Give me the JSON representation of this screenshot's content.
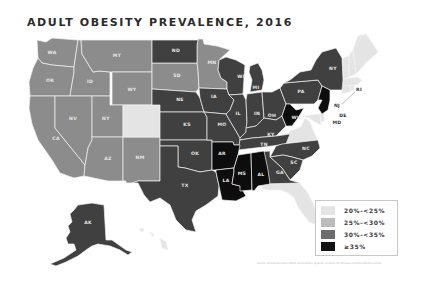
{
  "title": "ADULT OBESITY PREVALENCE, 2016",
  "colors": {
    "bin_20_25": "#e4e4e4",
    "bin_25_30": "#8c8c8c",
    "bin_30_35": "#404040",
    "bin_35_plus": "#0d0d0d"
  },
  "legend": {
    "items": [
      {
        "label": "20%-<25%",
        "color": "#e4e4e4"
      },
      {
        "label": "25%-<30%",
        "color": "#bcbcbc"
      },
      {
        "label": "30%-<35%",
        "color": "#6c6c6c"
      },
      {
        "label": "≥35%",
        "color": "#131313"
      }
    ]
  },
  "states": {
    "WA": "25%-<30%",
    "OR": "25%-<30%",
    "CA": "25%-<30%",
    "ID": "25%-<30%",
    "NV": "25%-<30%",
    "MT": "25%-<30%",
    "WY": "25%-<30%",
    "UT": "25%-<30%",
    "CO": "20%-<25%",
    "AZ": "25%-<30%",
    "NM": "25%-<30%",
    "ND": "30%-<35%",
    "SD": "25%-<30%",
    "NE": "30%-<35%",
    "KS": "30%-<35%",
    "OK": "30%-<35%",
    "TX": "30%-<35%",
    "MN": "25%-<30%",
    "IA": "30%-<35%",
    "MO": "30%-<35%",
    "AR": "≥35%",
    "LA": "≥35%",
    "WI": "30%-<35%",
    "IL": "30%-<35%",
    "MS": "≥35%",
    "MI": "30%-<35%",
    "IN": "30%-<35%",
    "KY": "30%-<35%",
    "TN": "30%-<35%",
    "AL": "≥35%",
    "OH": "30%-<35%",
    "WV": "≥35%",
    "GA": "30%-<35%",
    "FL": "20%-<25%",
    "SC": "30%-<35%",
    "NC": "30%-<35%",
    "VA": "20%-<25%",
    "PA": "30%-<35%",
    "NY": "30%-<35%",
    "NJ": "≥35%",
    "DE": "20%-<25%",
    "MD": "20%-<25%",
    "RI": "20%-<25%",
    "CT": "20%-<25%",
    "MA": "20%-<25%",
    "VT": "20%-<25%",
    "NH": "20%-<25%",
    "ME": "20%-<25%",
    "AK": "30%-<35%",
    "HI": "20%-<25%"
  },
  "labels": {
    "WA": "WA",
    "OR": "OR",
    "CA": "CA",
    "ID": "ID",
    "NV": "NV",
    "MT": "MT",
    "WY": "WY",
    "UT": "NY",
    "AZ": "AZ",
    "NM": "NM",
    "ND": "ND",
    "SD": "SD",
    "NE": "NE",
    "KS": "KS",
    "OK": "OK",
    "TX": "TX",
    "MN": "MN",
    "IA": "IA",
    "MO": "MO",
    "AR": "AR",
    "LA": "LA",
    "WI": "WI",
    "IL": "IL",
    "MS": "MS",
    "MI": "MI",
    "IN": "IN",
    "KY": "KY",
    "TN": "TN",
    "AL": "AL",
    "OH": "OH",
    "WV": "WV",
    "GA": "GA",
    "SC": "SC",
    "NC": "NC",
    "PA": "PA",
    "NY": "NY",
    "NJ": "NJ",
    "DE": "DE",
    "MD": "MD",
    "RI": "RI",
    "AK": "AK"
  },
  "source": "Source: Behavioral Risk Factor Surveillance System, Centers for Disease Control and Prevention"
}
